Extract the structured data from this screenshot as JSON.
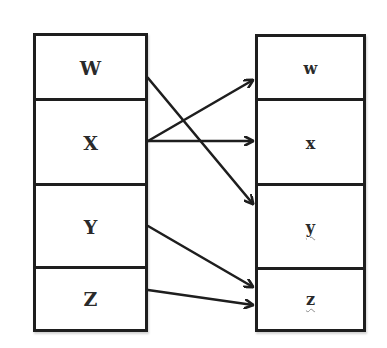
{
  "diagram": {
    "type": "mapping",
    "left_column": {
      "cells": [
        {
          "label": "W"
        },
        {
          "label": "X"
        },
        {
          "label": "Y"
        },
        {
          "label": "Z"
        }
      ]
    },
    "right_column": {
      "cells": [
        {
          "label": "w"
        },
        {
          "label": "x"
        },
        {
          "label": "y"
        },
        {
          "label": "z"
        }
      ]
    },
    "arrows": [
      {
        "from": "W",
        "to": "y"
      },
      {
        "from": "X",
        "to": "w"
      },
      {
        "from": "X",
        "to": "x"
      },
      {
        "from": "Y",
        "to": "z"
      },
      {
        "from": "Z",
        "to": "z"
      }
    ],
    "colors": {
      "line": "#1e1e1e",
      "background": "#ffffff",
      "spellcheck_underline": "#8a8a8a"
    }
  }
}
